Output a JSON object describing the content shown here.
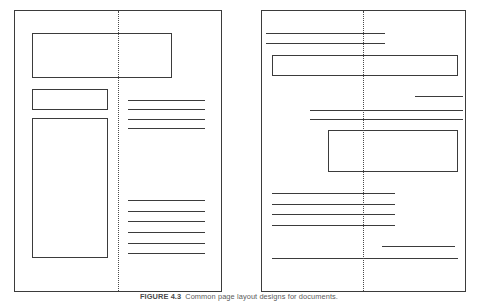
{
  "figure": {
    "caption_label": "FIGURE 4.3",
    "caption_text": "Common page layout designs for documents.",
    "background_color": "#ffffff",
    "line_color": "#3b3b3b",
    "fold_color": "#4a4a4a"
  },
  "pages": [
    {
      "id": "left-page",
      "name": "page-left",
      "frame": {
        "x": 14,
        "y": 10,
        "w": 208,
        "h": 282
      },
      "fold": {
        "x": 118,
        "y": 11,
        "h": 280
      },
      "boxes": [
        {
          "name": "box-header-wide",
          "x": 32,
          "y": 33,
          "w": 140,
          "h": 45
        },
        {
          "name": "box-subhead",
          "x": 32,
          "y": 89,
          "w": 76,
          "h": 21
        },
        {
          "name": "box-tall-column",
          "x": 32,
          "y": 118,
          "w": 76,
          "h": 140
        }
      ],
      "rules": [
        {
          "name": "rule-right-1",
          "x": 128,
          "y": 100,
          "w": 77
        },
        {
          "name": "rule-right-2",
          "x": 128,
          "y": 109,
          "w": 77
        },
        {
          "name": "rule-right-3",
          "x": 128,
          "y": 119,
          "w": 77
        },
        {
          "name": "rule-right-4",
          "x": 128,
          "y": 128,
          "w": 77
        },
        {
          "name": "rule-right-5",
          "x": 128,
          "y": 200,
          "w": 77
        },
        {
          "name": "rule-right-6",
          "x": 128,
          "y": 211,
          "w": 77
        },
        {
          "name": "rule-right-7",
          "x": 128,
          "y": 221,
          "w": 77
        },
        {
          "name": "rule-right-8",
          "x": 128,
          "y": 232,
          "w": 77
        },
        {
          "name": "rule-right-9",
          "x": 128,
          "y": 243,
          "w": 77
        },
        {
          "name": "rule-right-10",
          "x": 128,
          "y": 253,
          "w": 77
        }
      ]
    },
    {
      "id": "right-page",
      "name": "page-right",
      "frame": {
        "x": 261,
        "y": 10,
        "w": 205,
        "h": 282
      },
      "fold": {
        "x": 363,
        "y": 11,
        "h": 280
      },
      "boxes": [
        {
          "name": "box-banner-wide",
          "x": 272,
          "y": 55,
          "w": 186,
          "h": 21
        },
        {
          "name": "box-inset",
          "x": 328,
          "y": 130,
          "w": 130,
          "h": 42
        }
      ],
      "rules": [
        {
          "name": "rule-top-1",
          "x": 266,
          "y": 33,
          "w": 119
        },
        {
          "name": "rule-top-2",
          "x": 266,
          "y": 43,
          "w": 119
        },
        {
          "name": "rule-short-right",
          "x": 415,
          "y": 96,
          "w": 48
        },
        {
          "name": "rule-mid-1",
          "x": 310,
          "y": 110,
          "w": 153
        },
        {
          "name": "rule-mid-2",
          "x": 310,
          "y": 119,
          "w": 153
        },
        {
          "name": "rule-body-1",
          "x": 272,
          "y": 193,
          "w": 123
        },
        {
          "name": "rule-body-2",
          "x": 272,
          "y": 204,
          "w": 123
        },
        {
          "name": "rule-body-3",
          "x": 272,
          "y": 214,
          "w": 123
        },
        {
          "name": "rule-body-4",
          "x": 272,
          "y": 225,
          "w": 123
        },
        {
          "name": "rule-foot-short",
          "x": 382,
          "y": 246,
          "w": 73
        },
        {
          "name": "rule-foot-long",
          "x": 272,
          "y": 258,
          "w": 186
        }
      ]
    }
  ]
}
